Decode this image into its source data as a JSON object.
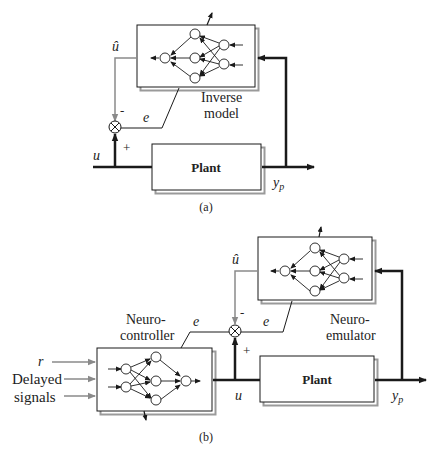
{
  "colors": {
    "line": "#1a1a1a",
    "feedback_gray": "#8a8a8a",
    "box_shadow": "#9a9a9a",
    "background": "#ffffff"
  },
  "diagram_a": {
    "caption": "(a)",
    "nn_block_label_line1": "Inverse",
    "nn_block_label_line2": "model",
    "plant_label": "Plant",
    "input_label": "u",
    "output_label": "y",
    "output_subscript": "p",
    "estimate_label": "û",
    "error_label": "e",
    "minus_sign": "-",
    "plus_sign": "+"
  },
  "diagram_b": {
    "caption": "(b)",
    "controller_label_line1": "Neuro-",
    "controller_label_line2": "controller",
    "emulator_label_line1": "Neuro-",
    "emulator_label_line2": "emulator",
    "plant_label": "Plant",
    "reference_label": "r",
    "delayed_label_line1": "Delayed",
    "delayed_label_line2": "signals",
    "control_label": "u",
    "output_label": "y",
    "output_subscript": "p",
    "estimate_label": "û",
    "error_left_label": "e",
    "error_right_label": "e",
    "minus_sign": "-",
    "plus_sign": "+"
  }
}
